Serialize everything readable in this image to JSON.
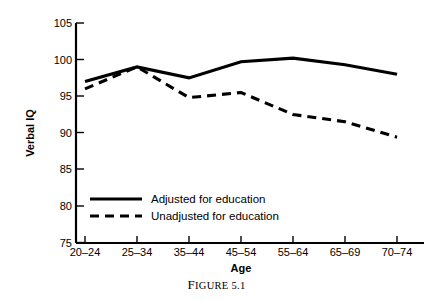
{
  "figure": {
    "caption": "Figure 5.1"
  },
  "chart_data": {
    "type": "line",
    "title": "",
    "xlabel": "Age",
    "ylabel": "Verbal IQ",
    "categories": [
      "20–24",
      "25–34",
      "35–44",
      "45–54",
      "55–64",
      "65–69",
      "70–74"
    ],
    "ylim": [
      75,
      105
    ],
    "yticks": [
      75,
      80,
      85,
      90,
      95,
      100,
      105
    ],
    "ytick_labels": [
      "75",
      "80",
      "85",
      "90",
      "95",
      "100",
      "105"
    ],
    "grid": false,
    "legend_position": "inside-lower-left",
    "series": [
      {
        "name": "Adjusted for education",
        "style": "solid",
        "color": "#000000",
        "values": [
          97.0,
          99.0,
          97.5,
          99.7,
          100.2,
          99.3,
          98.0
        ]
      },
      {
        "name": "Unadjusted for education",
        "style": "dashed",
        "color": "#000000",
        "values": [
          96.0,
          99.0,
          94.8,
          95.5,
          92.5,
          91.5,
          89.4
        ]
      }
    ]
  }
}
